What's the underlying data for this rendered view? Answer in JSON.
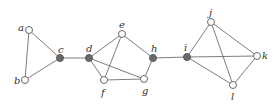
{
  "graph": {
    "nodes": [
      {
        "id": "a",
        "label": "a",
        "x": 29,
        "y": 30,
        "filled": false,
        "lx": 18,
        "ly": 23
      },
      {
        "id": "b",
        "label": "b",
        "x": 25,
        "y": 80,
        "filled": false,
        "lx": 14,
        "ly": 76
      },
      {
        "id": "c",
        "label": "c",
        "x": 60,
        "y": 58,
        "filled": true,
        "lx": 58,
        "ly": 45
      },
      {
        "id": "d",
        "label": "d",
        "x": 89,
        "y": 58,
        "filled": true,
        "lx": 86,
        "ly": 44
      },
      {
        "id": "e",
        "label": "e",
        "x": 122,
        "y": 34,
        "filled": false,
        "lx": 119,
        "ly": 20
      },
      {
        "id": "f",
        "label": "f",
        "x": 104,
        "y": 80,
        "filled": false,
        "lx": 101,
        "ly": 88
      },
      {
        "id": "g",
        "label": "g",
        "x": 144,
        "y": 79,
        "filled": false,
        "lx": 142,
        "ly": 86
      },
      {
        "id": "h",
        "label": "h",
        "x": 153,
        "y": 58,
        "filled": true,
        "lx": 151,
        "ly": 44
      },
      {
        "id": "i",
        "label": "i",
        "x": 187,
        "y": 57,
        "filled": true,
        "lx": 184,
        "ly": 43
      },
      {
        "id": "j",
        "label": "j",
        "x": 211,
        "y": 22,
        "filled": false,
        "lx": 209,
        "ly": 8
      },
      {
        "id": "k",
        "label": "k",
        "x": 257,
        "y": 56,
        "filled": false,
        "lx": 262,
        "ly": 51
      },
      {
        "id": "l",
        "label": "l",
        "x": 233,
        "y": 85,
        "filled": false,
        "lx": 231,
        "ly": 92
      }
    ],
    "edges": [
      [
        "a",
        "b"
      ],
      [
        "a",
        "c"
      ],
      [
        "b",
        "c"
      ],
      [
        "c",
        "d"
      ],
      [
        "d",
        "e"
      ],
      [
        "d",
        "f"
      ],
      [
        "d",
        "g"
      ],
      [
        "e",
        "f"
      ],
      [
        "e",
        "h"
      ],
      [
        "f",
        "g"
      ],
      [
        "g",
        "h"
      ],
      [
        "h",
        "i"
      ],
      [
        "i",
        "j"
      ],
      [
        "i",
        "k"
      ],
      [
        "i",
        "l"
      ],
      [
        "j",
        "k"
      ],
      [
        "j",
        "l"
      ],
      [
        "k",
        "l"
      ]
    ],
    "colors": {
      "edge": "#6e6e6e",
      "node_filled": "#6a6a6a",
      "node_hollow_fill": "#ffffff",
      "label": "#333333"
    },
    "node_radius": 3.5
  }
}
